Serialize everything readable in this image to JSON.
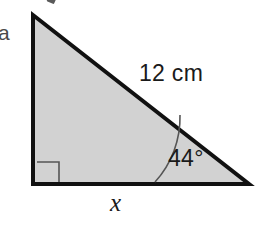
{
  "figure": {
    "type": "right-triangle-diagram",
    "background_color": "#ffffff",
    "fill_color": "#d2d2d2",
    "stroke_color": "#111111",
    "text_color": "#1a1a1a",
    "item_label": "a",
    "labels": {
      "hypotenuse": "12 cm",
      "angle": "44°",
      "base": "x"
    },
    "geometry": {
      "apex": [
        33,
        15
      ],
      "right_angle_vertex": [
        33,
        184
      ],
      "angle_vertex": [
        249,
        184
      ],
      "right_angle_marker_size": 22,
      "angle_arc_radius": 96,
      "stroke_width": 4
    },
    "annotations": {
      "right_angle_marker": "right-angle-square",
      "angle_arc": "angle-arc-44",
      "cropped_fragment": "partial-glyph-top-edge"
    }
  }
}
